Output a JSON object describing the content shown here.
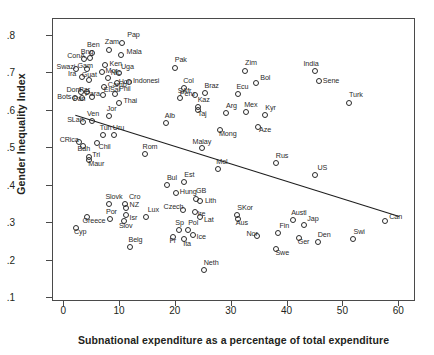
{
  "chart_data": {
    "type": "scatter",
    "title": "",
    "xlabel": "Subnational expenditure as a percentage of total expenditure",
    "ylabel": "Gender Inequality Index",
    "xlim": [
      -2,
      63
    ],
    "ylim": [
      0.09,
      0.845
    ],
    "xticks": [
      0,
      10,
      20,
      30,
      40,
      50,
      60
    ],
    "xtick_labels": [
      "0",
      "10",
      "20",
      "30",
      "40",
      "50",
      "60"
    ],
    "yticks": [
      0.1,
      0.2,
      0.3,
      0.4,
      0.5,
      0.6,
      0.7,
      0.8
    ],
    "ytick_labels": [
      ".1",
      ".2",
      ".3",
      ".4",
      ".5",
      ".6",
      ".7",
      ".8"
    ],
    "grid": false,
    "legend": null,
    "marker": "open-circle",
    "trendline": {
      "x0": 2.0,
      "y0": 0.588,
      "x1": 60.0,
      "y1": 0.318,
      "style": "solid"
    },
    "points": [
      {
        "label": "Pap",
        "x": 10.4,
        "y": 0.782,
        "lx": 5,
        "ly": -9
      },
      {
        "label": "Zam",
        "x": 8.0,
        "y": 0.762,
        "lx": -4,
        "ly": -9
      },
      {
        "label": "Mala",
        "x": 10.1,
        "y": 0.748,
        "lx": 6,
        "ly": -4
      },
      {
        "label": "Ben",
        "x": 5.0,
        "y": 0.755,
        "lx": -5,
        "ly": -9
      },
      {
        "label": "ConA",
        "x": 3.6,
        "y": 0.738,
        "lx": -17,
        "ly": -4
      },
      {
        "label": "Bng",
        "x": 4.6,
        "y": 0.74,
        "lx": -9,
        "ly": -7
      },
      {
        "label": "Ken",
        "x": 7.4,
        "y": 0.722,
        "lx": 4,
        "ly": -2
      },
      {
        "label": "Swazi",
        "x": 2.2,
        "y": 0.712,
        "lx": -20,
        "ly": -3
      },
      {
        "label": "Gam",
        "x": 4.0,
        "y": 0.712,
        "lx": -9,
        "ly": -4
      },
      {
        "label": "Mor",
        "x": 6.7,
        "y": 0.703,
        "lx": 4,
        "ly": -2
      },
      {
        "label": "Uga",
        "x": 9.8,
        "y": 0.7,
        "lx": 2,
        "ly": -7
      },
      {
        "label": "Zim",
        "x": 32.4,
        "y": 0.706,
        "lx": 0,
        "ly": -9
      },
      {
        "label": "Ira",
        "x": 3.2,
        "y": 0.69,
        "lx": -14,
        "ly": -4
      },
      {
        "label": "Guat",
        "x": 4.4,
        "y": 0.682,
        "lx": -7,
        "ly": -6
      },
      {
        "label": "Nic",
        "x": 7.8,
        "y": 0.687,
        "lx": 3,
        "ly": -6
      },
      {
        "label": "Hon",
        "x": 9.4,
        "y": 0.673,
        "lx": 2,
        "ly": -2
      },
      {
        "label": "Indonesi",
        "x": 11.6,
        "y": 0.676,
        "lx": 4,
        "ly": -2
      },
      {
        "label": "Bol",
        "x": 34.4,
        "y": 0.673,
        "lx": 4,
        "ly": -6
      },
      {
        "label": "Dom",
        "x": 3.1,
        "y": 0.651,
        "lx": -15,
        "ly": -3
      },
      {
        "label": "Par",
        "x": 4.1,
        "y": 0.65,
        "lx": -8,
        "ly": -3
      },
      {
        "label": "Camb",
        "x": 7.1,
        "y": 0.663,
        "lx": 4,
        "ly": -3
      },
      {
        "label": "Ecu",
        "x": 31.2,
        "y": 0.645,
        "lx": -2,
        "ly": -8
      },
      {
        "label": "Phil",
        "x": 9.1,
        "y": 0.646,
        "lx": 4,
        "ly": -6
      },
      {
        "label": "Bots",
        "x": 2.0,
        "y": 0.634,
        "lx": -18,
        "ly": -2
      },
      {
        "label": "Pan",
        "x": 3.2,
        "y": 0.633,
        "lx": -9,
        "ly": 0
      },
      {
        "label": "Para",
        "x": 5.0,
        "y": 0.637,
        "lx": -7,
        "ly": -4
      },
      {
        "label": "ElSal",
        "x": 6.9,
        "y": 0.641,
        "lx": 1,
        "ly": -6
      },
      {
        "label": "Thai",
        "x": 9.9,
        "y": 0.621,
        "lx": 4,
        "ly": -3
      },
      {
        "label": "Col",
        "x": 21.5,
        "y": 0.661,
        "lx": -1,
        "ly": -8
      },
      {
        "label": "Pak",
        "x": 19.8,
        "y": 0.713,
        "lx": 0,
        "ly": -9
      },
      {
        "label": "Peru",
        "x": 23.4,
        "y": 0.641,
        "lx": -15,
        "ly": -2
      },
      {
        "label": "Braz",
        "x": 25.3,
        "y": 0.648,
        "lx": -1,
        "ly": -8
      },
      {
        "label": "SAfr",
        "x": 20.7,
        "y": 0.635,
        "lx": -2,
        "ly": -8
      },
      {
        "label": "India",
        "x": 45.0,
        "y": 0.705,
        "lx": -12,
        "ly": -8
      },
      {
        "label": "Sene",
        "x": 45.6,
        "y": 0.68,
        "lx": 4,
        "ly": -1
      },
      {
        "label": "Turk",
        "x": 51.0,
        "y": 0.621,
        "lx": 0,
        "ly": -9
      },
      {
        "label": "Jor",
        "x": 8.0,
        "y": 0.587,
        "lx": -2,
        "ly": -8
      },
      {
        "label": "Mex",
        "x": 32.6,
        "y": 0.597,
        "lx": -2,
        "ly": -8
      },
      {
        "label": "Kyr",
        "x": 36.0,
        "y": 0.589,
        "lx": 0,
        "ly": -8
      },
      {
        "label": "Kaz",
        "x": 23.9,
        "y": 0.61,
        "lx": 0,
        "ly": -8
      },
      {
        "label": "Taj",
        "x": 23.9,
        "y": 0.601,
        "lx": 0,
        "ly": 3
      },
      {
        "label": "Arg",
        "x": 29.0,
        "y": 0.594,
        "lx": 0,
        "ly": -8
      },
      {
        "label": "Ven",
        "x": 5.0,
        "y": 0.572,
        "lx": -5,
        "ly": -8
      },
      {
        "label": "SLan",
        "x": 3.4,
        "y": 0.571,
        "lx": -16,
        "ly": -3
      },
      {
        "label": "Alb",
        "x": 18.2,
        "y": 0.568,
        "lx": -1,
        "ly": -8
      },
      {
        "label": "Aze",
        "x": 34.7,
        "y": 0.557,
        "lx": 1,
        "ly": 2
      },
      {
        "label": "Mong",
        "x": 27.9,
        "y": 0.549,
        "lx": -1,
        "ly": 3
      },
      {
        "label": "Uru",
        "x": 8.9,
        "y": 0.536,
        "lx": -1,
        "ly": -8
      },
      {
        "label": "Tun",
        "x": 6.9,
        "y": 0.535,
        "lx": -3,
        "ly": -8
      },
      {
        "label": "CRica",
        "x": 2.6,
        "y": 0.516,
        "lx": -19,
        "ly": -3
      },
      {
        "label": "Bah",
        "x": 3.3,
        "y": 0.505,
        "lx": -5,
        "ly": 2
      },
      {
        "label": "Chil",
        "x": 5.8,
        "y": 0.514,
        "lx": 2,
        "ly": 3
      },
      {
        "label": "Tri",
        "x": 4.5,
        "y": 0.476,
        "lx": 3,
        "ly": -3
      },
      {
        "label": "Maur",
        "x": 4.5,
        "y": 0.47,
        "lx": -1,
        "ly": 3
      },
      {
        "label": "Malay",
        "x": 24.6,
        "y": 0.5,
        "lx": -9,
        "ly": -7
      },
      {
        "label": "Rom",
        "x": 14.4,
        "y": 0.486,
        "lx": -2,
        "ly": -8
      },
      {
        "label": "Rus",
        "x": 37.9,
        "y": 0.462,
        "lx": 0,
        "ly": -8
      },
      {
        "label": "Mol",
        "x": 27.6,
        "y": 0.446,
        "lx": -2,
        "ly": -8
      },
      {
        "label": "Bul",
        "x": 18.4,
        "y": 0.403,
        "lx": 0,
        "ly": -8
      },
      {
        "label": "Est",
        "x": 21.5,
        "y": 0.409,
        "lx": 0,
        "ly": -8
      },
      {
        "label": "US",
        "x": 45.0,
        "y": 0.429,
        "lx": 2,
        "ly": -8
      },
      {
        "label": "Hung",
        "x": 20.0,
        "y": 0.38,
        "lx": 4,
        "ly": -2
      },
      {
        "label": "GB",
        "x": 23.6,
        "y": 0.366,
        "lx": 0,
        "ly": -9
      },
      {
        "label": "Lith",
        "x": 24.3,
        "y": 0.36,
        "lx": 5,
        "ly": -1
      },
      {
        "label": "Slovk",
        "x": 8.1,
        "y": 0.352,
        "lx": -4,
        "ly": -8
      },
      {
        "label": "Cro",
        "x": 10.9,
        "y": 0.351,
        "lx": 4,
        "ly": -8
      },
      {
        "label": "NZ",
        "x": 11.0,
        "y": 0.34,
        "lx": 4,
        "ly": -4
      },
      {
        "label": "Czech",
        "x": 21.2,
        "y": 0.335,
        "lx": -19,
        "ly": -4
      },
      {
        "label": "Ire",
        "x": 23.5,
        "y": 0.33,
        "lx": 2,
        "ly": 1
      },
      {
        "label": "Lux",
        "x": 14.6,
        "y": 0.318,
        "lx": 2,
        "ly": -8
      },
      {
        "label": "Por",
        "x": 8.2,
        "y": 0.312,
        "lx": -4,
        "ly": -8
      },
      {
        "label": "Isr",
        "x": 11.0,
        "y": 0.322,
        "lx": 4,
        "ly": 2
      },
      {
        "label": "Lat",
        "x": 24.3,
        "y": 0.318,
        "lx": 4,
        "ly": 2
      },
      {
        "label": "Greece",
        "x": 4.0,
        "y": 0.317,
        "lx": -4,
        "ly": 3
      },
      {
        "label": "Pol",
        "x": 22.2,
        "y": 0.282,
        "lx": 0,
        "ly": -8
      },
      {
        "label": "Sp",
        "x": 20.6,
        "y": 0.282,
        "lx": -4,
        "ly": -8
      },
      {
        "label": "SKor",
        "x": 31.0,
        "y": 0.322,
        "lx": 0,
        "ly": -8
      },
      {
        "label": "Aus",
        "x": 31.1,
        "y": 0.312,
        "lx": -2,
        "ly": 3
      },
      {
        "label": "Austl",
        "x": 41.0,
        "y": 0.31,
        "lx": -2,
        "ly": -8
      },
      {
        "label": "Jap",
        "x": 43.0,
        "y": 0.296,
        "lx": 3,
        "ly": -7
      },
      {
        "label": "Cyp",
        "x": 2.1,
        "y": 0.287,
        "lx": -2,
        "ly": 3
      },
      {
        "label": "Slov",
        "x": 10.7,
        "y": 0.305,
        "lx": -5,
        "ly": 4
      },
      {
        "label": "Ice",
        "x": 23.0,
        "y": 0.268,
        "lx": 4,
        "ly": 1
      },
      {
        "label": "Fr",
        "x": 19.4,
        "y": 0.264,
        "lx": -3,
        "ly": 3
      },
      {
        "label": "Ita",
        "x": 21.5,
        "y": 0.257,
        "lx": -1,
        "ly": 4
      },
      {
        "label": "Nor",
        "x": 34.6,
        "y": 0.266,
        "lx": -11,
        "ly": -3
      },
      {
        "label": "Fin",
        "x": 38.2,
        "y": 0.275,
        "lx": 2,
        "ly": -8
      },
      {
        "label": "Ger",
        "x": 42.0,
        "y": 0.262,
        "lx": -1,
        "ly": 3
      },
      {
        "label": "Den",
        "x": 45.4,
        "y": 0.251,
        "lx": 0,
        "ly": -8
      },
      {
        "label": "Swi",
        "x": 51.8,
        "y": 0.257,
        "lx": 0,
        "ly": -8
      },
      {
        "label": "Belg",
        "x": 11.7,
        "y": 0.238,
        "lx": -1,
        "ly": -8
      },
      {
        "label": "Swe",
        "x": 38.0,
        "y": 0.232,
        "lx": -1,
        "ly": 3
      },
      {
        "label": "Neth",
        "x": 25.0,
        "y": 0.176,
        "lx": 0,
        "ly": -8
      },
      {
        "label": "Can",
        "x": 57.5,
        "y": 0.307,
        "lx": 4,
        "ly": -5
      }
    ]
  }
}
